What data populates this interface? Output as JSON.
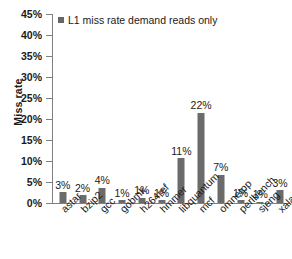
{
  "chart_data": {
    "type": "bar",
    "title": "",
    "subtitle": "",
    "xlabel": "",
    "ylabel": "Miss rate",
    "ylim": [
      0,
      45
    ],
    "ytick_step": 5,
    "ytick_labels": [
      "0%",
      "5%",
      "10%",
      "15%",
      "20%",
      "25%",
      "30%",
      "35%",
      "40%",
      "45%"
    ],
    "ytick_values": [
      0,
      5,
      10,
      15,
      20,
      25,
      30,
      35,
      40,
      45
    ],
    "grid": false,
    "legend_position": "top-left-inside",
    "legend": [
      "L1 miss rate demand reads only"
    ],
    "categories": [
      "astar",
      "bzip2",
      "gcc",
      "gobmk",
      "h264ref",
      "hmmer",
      "libquantum",
      "mcf",
      "omnetpp",
      "perlbench",
      "sjeng",
      "xalancbmk"
    ],
    "values": [
      2.6,
      1.9,
      3.6,
      0.6,
      1.2,
      0.6,
      10.6,
      21.5,
      6.7,
      0.6,
      0.3,
      3.0
    ],
    "data_labels": [
      "3%",
      "2%",
      "4%",
      "1%",
      "1%",
      "1%",
      "11%",
      "22%",
      "7%",
      "1%",
      "1%",
      "3%"
    ],
    "series": [
      {
        "name": "L1 miss rate demand reads only",
        "color": "#6b6b6b",
        "values": [
          2.6,
          1.9,
          3.6,
          0.6,
          1.2,
          0.6,
          10.6,
          21.5,
          6.7,
          0.6,
          0.3,
          3.0
        ]
      }
    ]
  },
  "colors": {
    "bar": "#6b6b6b",
    "legend_swatch": "#676767",
    "axis": "#808080",
    "text": "#1a1a1a",
    "background": "#ffffff"
  }
}
